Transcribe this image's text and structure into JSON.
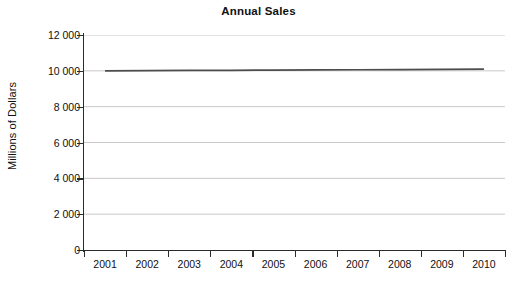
{
  "chart_data": {
    "type": "line",
    "title": "Annual Sales",
    "xlabel": "",
    "ylabel": "Millions of Dollars",
    "categories": [
      "2001",
      "2002",
      "2003",
      "2004",
      "2005",
      "2006",
      "2007",
      "2008",
      "2009",
      "2010"
    ],
    "x": [
      2001,
      2002,
      2003,
      2004,
      2005,
      2006,
      2007,
      2008,
      2009,
      2010
    ],
    "series": [
      {
        "name": "Annual Sales",
        "values": [
          10000,
          10010,
          10020,
          10030,
          10040,
          10050,
          10060,
          10070,
          10080,
          10090
        ],
        "color": "#4d4d4d"
      }
    ],
    "ylim": [
      0,
      12000
    ],
    "yticks": [
      0,
      2000,
      4000,
      6000,
      8000,
      10000,
      12000
    ],
    "ytick_labels": [
      "0",
      "2 000",
      "4 000",
      "6 000",
      "8 000",
      "10 000",
      "12 000"
    ],
    "grid": true,
    "grid_axis": "y",
    "grid_color": "#c8c8c8",
    "legend": false,
    "legend_position": "none",
    "axis_color": "#2b2b2b",
    "background_color": "#ffffff"
  }
}
